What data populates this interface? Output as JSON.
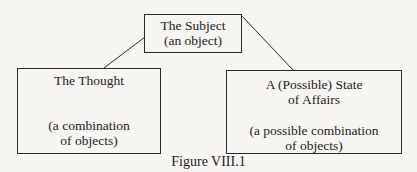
{
  "diagram": {
    "nodes": [
      {
        "id": "subject",
        "lines": [
          "The Subject",
          "(an object)"
        ]
      },
      {
        "id": "thought",
        "title": "The Thought",
        "subtitle": [
          "(a combination",
          "of objects)"
        ]
      },
      {
        "id": "state",
        "title": [
          "A (Possible) State",
          "of Affairs"
        ],
        "subtitle": [
          "(a possible combination",
          "of objects)"
        ]
      }
    ],
    "edges": [
      {
        "from": "subject",
        "to": "thought"
      },
      {
        "from": "subject",
        "to": "state"
      }
    ],
    "caption": "Figure VIII.1",
    "colors": {
      "line": "#2a2a2a",
      "background": "#f6f5f2"
    }
  }
}
